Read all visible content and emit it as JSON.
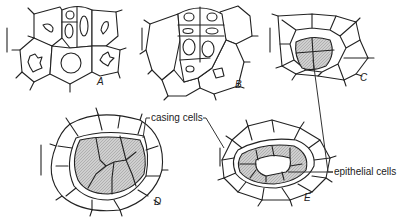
{
  "figure": {
    "panels": [
      {
        "id": "A",
        "label": "A"
      },
      {
        "id": "B",
        "label": "B"
      },
      {
        "id": "C",
        "label": "C"
      },
      {
        "id": "D",
        "label": "D"
      },
      {
        "id": "E",
        "label": "E"
      }
    ],
    "annotations": {
      "casing_cells": "casing cells",
      "epithelial_cells": "epithelial cells"
    },
    "colors": {
      "line": "#222222",
      "shaded_fill": "#c8c8c8",
      "background": "#ffffff"
    }
  }
}
